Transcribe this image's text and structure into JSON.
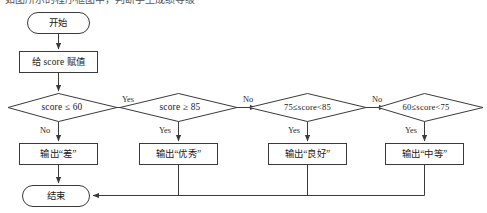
{
  "figure": {
    "type": "flowchart",
    "clipped_caption_above": "如图所示的程序框图中，判断学生成绩等级",
    "line_color": "#3a3a3a",
    "background_color": "#ffffff"
  },
  "nodes": {
    "start": {
      "label": "开始",
      "shape": "terminator"
    },
    "assign": {
      "label": "给 score 赋值",
      "shape": "process"
    },
    "decision1": {
      "label": "score ≤ 60",
      "shape": "decision"
    },
    "decision2": {
      "label": "score ≥ 85",
      "shape": "decision"
    },
    "decision3": {
      "label": "75≤score<85",
      "shape": "decision"
    },
    "decision4": {
      "label": "60≤score<75",
      "shape": "decision"
    },
    "output1": {
      "label": "输出“差”",
      "shape": "process"
    },
    "output2": {
      "label": "输出“优秀”",
      "shape": "process"
    },
    "output3": {
      "label": "输出“良好”",
      "shape": "process"
    },
    "output4": {
      "label": "输出“中等”",
      "shape": "process"
    },
    "end": {
      "label": "结束",
      "shape": "terminator"
    }
  },
  "edge_labels": {
    "d1_yes": "Yes",
    "d1_no": "No",
    "d2_no": "No",
    "d2_yes": "Yes",
    "d3_no": "No",
    "d3_yes": "Yes",
    "d4_no": "No",
    "d4_yes": "Yes"
  }
}
